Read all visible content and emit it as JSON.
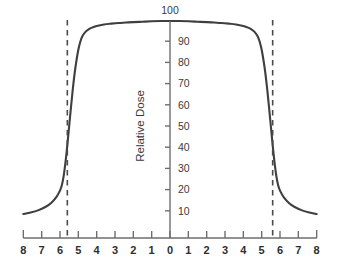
{
  "chart_data": {
    "type": "line",
    "title": "",
    "subtitle": "",
    "xlabel": "",
    "ylabel": "Relative Dose",
    "x_tick_labels": [
      "8",
      "7",
      "6",
      "5",
      "4",
      "3",
      "2",
      "1",
      "0",
      "1",
      "2",
      "3",
      "4",
      "5",
      "6",
      "7",
      "8"
    ],
    "x_tick_values": [
      -8,
      -7,
      -6,
      -5,
      -4,
      -3,
      -2,
      -1,
      0,
      1,
      2,
      3,
      4,
      5,
      6,
      7,
      8
    ],
    "y_tick_labels": [
      "10",
      "20",
      "30",
      "40",
      "50",
      "60",
      "70",
      "80",
      "90",
      "100"
    ],
    "y_tick_values": [
      10,
      20,
      30,
      40,
      50,
      60,
      70,
      80,
      90,
      100
    ],
    "xlim": [
      -8.4,
      8.4
    ],
    "ylim": [
      0,
      104
    ],
    "grid": false,
    "legend": null,
    "series": [
      {
        "name": "Relative Dose Profile",
        "color": "#3f3f3f",
        "x": [
          -8.0,
          -7.6,
          -7.2,
          -6.8,
          -6.5,
          -6.2,
          -6.0,
          -5.9,
          -5.8,
          -5.7,
          -5.6,
          -5.5,
          -5.4,
          -5.3,
          -5.2,
          -5.1,
          -5.0,
          -4.9,
          -4.8,
          -4.6,
          -4.4,
          -4.2,
          -4.0,
          -3.6,
          -3.2,
          -2.8,
          -2.4,
          -2.0,
          -1.5,
          -1.0,
          -0.5,
          0.0,
          0.5,
          1.0,
          1.5,
          2.0,
          2.4,
          2.8,
          3.2,
          3.6,
          4.0,
          4.2,
          4.4,
          4.6,
          4.8,
          4.9,
          5.0,
          5.1,
          5.2,
          5.3,
          5.4,
          5.5,
          5.6,
          5.7,
          5.8,
          5.9,
          6.0,
          6.2,
          6.5,
          6.8,
          7.2,
          7.6,
          8.0
        ],
        "y": [
          8.5,
          9.2,
          10.2,
          11.8,
          13.6,
          16.5,
          19.5,
          22.0,
          26.5,
          33.0,
          41.0,
          50.0,
          59.0,
          67.5,
          75.0,
          81.0,
          86.0,
          89.5,
          92.0,
          94.5,
          95.8,
          96.6,
          97.2,
          97.9,
          98.3,
          98.6,
          98.8,
          99.0,
          99.2,
          99.4,
          99.5,
          99.5,
          99.5,
          99.4,
          99.2,
          99.0,
          98.8,
          98.6,
          98.3,
          97.9,
          97.2,
          96.6,
          95.8,
          94.5,
          92.0,
          89.5,
          86.0,
          81.0,
          75.0,
          67.5,
          59.0,
          50.0,
          41.0,
          33.0,
          26.5,
          22.0,
          19.5,
          16.5,
          13.6,
          11.8,
          10.2,
          9.2,
          8.5
        ]
      }
    ],
    "annotations": [
      {
        "type": "vline",
        "name": "field-edge-left",
        "x": -5.6,
        "style": "dashed",
        "color": "#4a4a4a",
        "label": ""
      },
      {
        "type": "vline",
        "name": "field-edge-right",
        "x": 5.6,
        "style": "dashed",
        "color": "#4a4a4a",
        "label": ""
      }
    ],
    "notes": {
      "peak_dose": 99.5,
      "field_edge_dose": 50,
      "field_width": 11.2,
      "tail_dose": 8.5
    }
  },
  "axes": {
    "y_axis_title": "Relative Dose",
    "y_top_label": "100"
  },
  "colors": {
    "curve": "#3f3f3f",
    "axis": "#6e6e6e",
    "dashed": "#4a4a4a",
    "text": "#2f2f2f",
    "background": "#ffffff"
  }
}
